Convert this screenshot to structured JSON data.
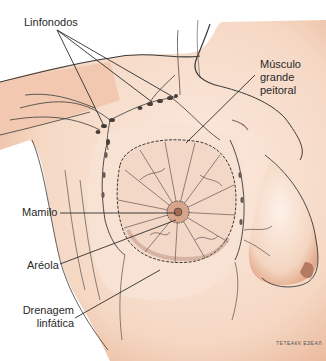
{
  "diagram": {
    "colors": {
      "skin": "#f6dccb",
      "skin_shadow": "#eab79a",
      "areola": "#c9957a",
      "line": "#3a3a3a",
      "background": "#ffffff"
    },
    "labels": {
      "linfonodos": "Linfonodos",
      "musculo_1": "Músculo",
      "musculo_2": "grande",
      "musculo_3": "peitoral",
      "mamilo": "Mamilo",
      "areola": "Aréola",
      "drenagem_1": "Drenagem",
      "drenagem_2": "linfática"
    },
    "signature": "ТЕТЕАКК ЕЗЕАЛ"
  }
}
